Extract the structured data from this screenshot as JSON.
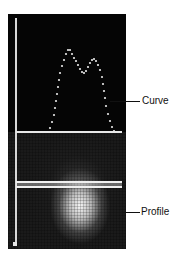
{
  "labels": {
    "curve": "Curve",
    "profile": "Profile"
  },
  "colors": {
    "panel_bg": "#050505",
    "trace": "#e8e8e8",
    "label_text": "#111111"
  },
  "curve_points": [
    [
      40,
      118
    ],
    [
      42,
      114
    ],
    [
      44,
      108
    ],
    [
      46,
      101
    ],
    [
      47,
      94
    ],
    [
      48,
      87
    ],
    [
      49,
      80
    ],
    [
      50,
      73
    ],
    [
      51,
      66
    ],
    [
      52,
      59
    ],
    [
      54,
      52
    ],
    [
      56,
      46
    ],
    [
      58,
      40
    ],
    [
      60,
      36
    ],
    [
      62,
      36
    ],
    [
      64,
      40
    ],
    [
      66,
      44
    ],
    [
      68,
      47
    ],
    [
      70,
      51
    ],
    [
      72,
      55
    ],
    [
      74,
      58
    ],
    [
      76,
      59
    ],
    [
      78,
      57
    ],
    [
      80,
      53
    ],
    [
      82,
      49
    ],
    [
      84,
      46
    ],
    [
      86,
      45
    ],
    [
      88,
      47
    ],
    [
      90,
      51
    ],
    [
      92,
      56
    ],
    [
      94,
      63
    ],
    [
      95,
      70
    ],
    [
      96,
      77
    ],
    [
      97,
      84
    ],
    [
      98,
      92
    ],
    [
      100,
      100
    ],
    [
      102,
      107
    ],
    [
      104,
      113
    ],
    [
      106,
      117
    ]
  ]
}
